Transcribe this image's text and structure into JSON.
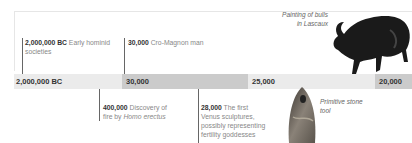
{
  "timeline": {
    "bands": [
      {
        "label": "2,000,000 BC",
        "color": "#ebebeb"
      },
      {
        "label": "30,000",
        "color": "#cbcbcb"
      },
      {
        "label": "25,000",
        "color": "#ebebeb"
      },
      {
        "label": "20,000",
        "color": "#cbcbcb"
      }
    ],
    "events_above": [
      {
        "year": "2,000,000 BC",
        "text": "Early hominid societies"
      },
      {
        "year": "30,000",
        "text": "Cro-Magnon man"
      }
    ],
    "events_below": [
      {
        "year": "400,000",
        "text_before": "Discovery of fire by ",
        "text_italic": "Homo erectus"
      },
      {
        "year": "28,000",
        "text": "The first Venus sculptures, possibly representing fertility goddesses"
      }
    ]
  },
  "images": {
    "bull": {
      "caption_line1": "Painting of bulls",
      "caption_line2": "in Lascaux"
    },
    "stone_tool": {
      "caption_line1": "Primitive stone",
      "caption_line2": "tool"
    }
  }
}
